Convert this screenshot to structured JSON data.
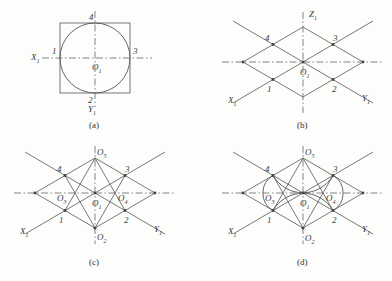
{
  "figure": {
    "line_color": "#555555",
    "background_color": "#fdfdfb",
    "label_color": "#3a3a3a"
  },
  "panels": [
    {
      "id": "a",
      "caption": "(a)",
      "description": "Front view: circle inscribed in a square with centre lines",
      "center_label": "O1",
      "axis_labels": {
        "x": "X1",
        "y": "Y1"
      },
      "point_labels": [
        "1",
        "2",
        "3",
        "4"
      ]
    },
    {
      "id": "b",
      "caption": "(b)",
      "description": "Isometric axes and rhombus with tangent points",
      "center_label": "O1",
      "axis_labels": {
        "x": "X1",
        "y": "Y1",
        "z": "Z1"
      },
      "point_labels": [
        "1",
        "2",
        "3",
        "4"
      ]
    },
    {
      "id": "c",
      "caption": "(c)",
      "description": "Construction lines locating the four arc centres",
      "center_label": "O1",
      "axis_labels": {
        "x": "X1",
        "y": "Y1"
      },
      "point_labels": [
        "1",
        "2",
        "3",
        "4"
      ],
      "arc_center_labels": [
        "O2",
        "O3",
        "O4",
        "O5"
      ]
    },
    {
      "id": "d",
      "caption": "(d)",
      "description": "Completed four-centred oval inscribed in the rhombus",
      "center_label": "O1",
      "axis_labels": {
        "x": "X1",
        "y": "Y1"
      },
      "point_labels": [
        "1",
        "2",
        "3",
        "4"
      ],
      "arc_center_labels": [
        "O2",
        "O3",
        "O4",
        "O5"
      ]
    }
  ],
  "labels": {
    "a": {
      "p1": "1",
      "p2": "2",
      "p3": "3",
      "p4": "4",
      "x": "X",
      "xs": "1",
      "y": "Y",
      "ys": "1",
      "o1": "O",
      "o1s": "1",
      "caption": "(a)"
    },
    "b": {
      "p1": "1",
      "p2": "2",
      "p3": "3",
      "p4": "4",
      "x": "X",
      "xs": "1",
      "y": "Y",
      "ys": "1",
      "z": "Z",
      "zs": "1",
      "o1": "O",
      "o1s": "1",
      "caption": "(b)"
    },
    "c": {
      "p1": "1",
      "p2": "2",
      "p3": "3",
      "p4": "4",
      "x": "X",
      "xs": "1",
      "y": "Y",
      "ys": "1",
      "o1": "O",
      "o1s": "1",
      "o2": "O",
      "o2s": "2",
      "o3": "O",
      "o3s": "3",
      "o4": "O",
      "o4s": "4",
      "o5": "O",
      "o5s": "5",
      "caption": "(c)"
    },
    "d": {
      "p1": "1",
      "p2": "2",
      "p3": "3",
      "p4": "4",
      "x": "X",
      "xs": "1",
      "y": "Y",
      "ys": "1",
      "o1": "O",
      "o1s": "1",
      "o2": "O",
      "o2s": "2",
      "o3": "O",
      "o3s": "3",
      "o4": "O",
      "o4s": "4",
      "o5": "O",
      "o5s": "5",
      "caption": "(d)"
    }
  }
}
